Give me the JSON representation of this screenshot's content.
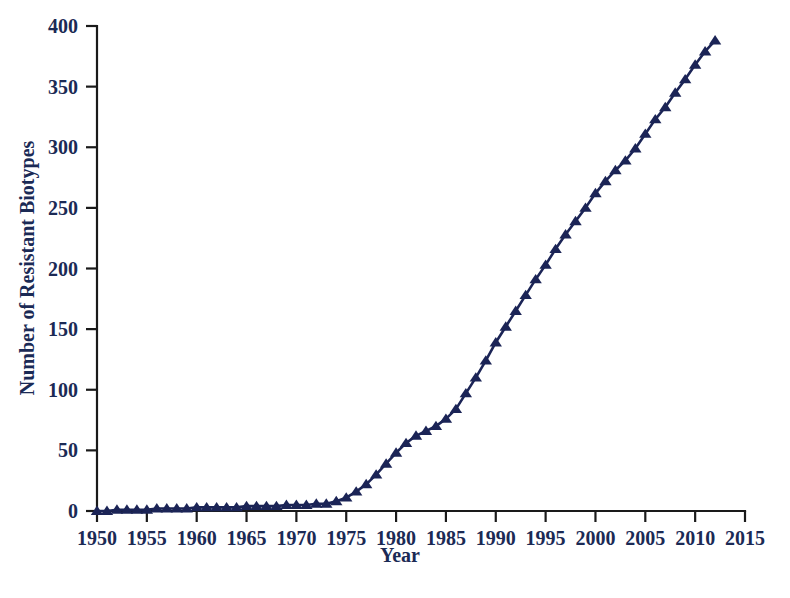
{
  "figure": {
    "background_color": "#ffffff",
    "series_color": "#1b2456",
    "axis_color": "#1a1a1a",
    "label_color": "#1b2a55",
    "caption_partial": "             "
  },
  "chart_data": {
    "type": "line",
    "title": "",
    "subtitle": "",
    "xlabel": "Year",
    "ylabel": "Number of Resistant Biotypes",
    "xlim": [
      1950,
      2015
    ],
    "ylim": [
      0,
      400
    ],
    "xticks": [
      1950,
      1955,
      1960,
      1965,
      1970,
      1975,
      1980,
      1985,
      1990,
      1995,
      2000,
      2005,
      2010,
      2015
    ],
    "xtick_labels": [
      "1950",
      "1955",
      "1960",
      "1965",
      "1970",
      "1975",
      "1980",
      "1985",
      "1990",
      "1995",
      "2000",
      "2005",
      "2010",
      "2015"
    ],
    "yticks": [
      0,
      50,
      100,
      150,
      200,
      250,
      300,
      350,
      400
    ],
    "ytick_labels": [
      "0",
      "50",
      "100",
      "150",
      "200",
      "250",
      "300",
      "350",
      "400"
    ],
    "grid": false,
    "legend": false,
    "legend_position": "none",
    "marker": "triangle-up",
    "series": [
      {
        "name": "Resistant biotypes",
        "color": "#1b2456",
        "x": [
          1950,
          1951,
          1952,
          1953,
          1954,
          1955,
          1956,
          1957,
          1958,
          1959,
          1960,
          1961,
          1962,
          1963,
          1964,
          1965,
          1966,
          1967,
          1968,
          1969,
          1970,
          1971,
          1972,
          1973,
          1974,
          1975,
          1976,
          1977,
          1978,
          1979,
          1980,
          1981,
          1982,
          1983,
          1984,
          1985,
          1986,
          1987,
          1988,
          1989,
          1990,
          1991,
          1992,
          1993,
          1994,
          1995,
          1996,
          1997,
          1998,
          1999,
          2000,
          2001,
          2002,
          2003,
          2004,
          2005,
          2006,
          2007,
          2008,
          2009,
          2010,
          2011,
          2012
        ],
        "values": [
          0,
          0,
          1,
          1,
          1,
          1,
          2,
          2,
          2,
          2,
          3,
          3,
          3,
          3,
          3,
          4,
          4,
          4,
          4,
          5,
          5,
          5,
          6,
          6,
          8,
          11,
          16,
          22,
          30,
          39,
          48,
          56,
          62,
          66,
          70,
          76,
          84,
          97,
          110,
          124,
          139,
          152,
          165,
          178,
          191,
          203,
          216,
          228,
          239,
          250,
          262,
          272,
          281,
          289,
          299,
          311,
          323,
          333,
          345,
          356,
          368,
          379,
          388
        ]
      }
    ]
  }
}
